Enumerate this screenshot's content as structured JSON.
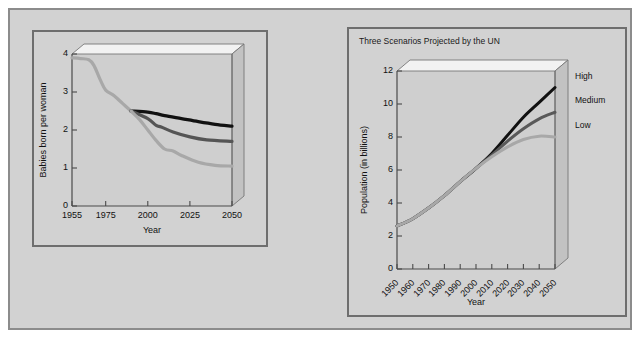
{
  "figure": {
    "background_color": "#d2d2d2",
    "border_color": "#8c8c8c"
  },
  "chart_data": [
    {
      "id": "fertility",
      "type": "line",
      "title": "",
      "xlabel": "Year",
      "ylabel": "Babies born per woman",
      "xlim": [
        1955,
        2050
      ],
      "ylim": [
        0,
        4
      ],
      "xticks": [
        "1955",
        "1975",
        "2000",
        "2025",
        "2050"
      ],
      "xtick_values": [
        1955,
        1975,
        2000,
        2025,
        2050
      ],
      "yticks": [
        "0",
        "1",
        "2",
        "3",
        "4"
      ],
      "ytick_values": [
        0,
        1,
        2,
        3,
        4
      ],
      "grid": false,
      "legend": "none",
      "style": "3d-box",
      "series": [
        {
          "name": "Historical",
          "color": "#a8a8a8",
          "width": 3.2,
          "x": [
            1955,
            1960,
            1965,
            1968,
            1972,
            1975,
            1980,
            1985,
            1990
          ],
          "values": [
            3.9,
            3.88,
            3.85,
            3.7,
            3.3,
            3.05,
            2.9,
            2.7,
            2.5
          ]
        },
        {
          "name": "High",
          "color": "#111111",
          "width": 3.2,
          "x": [
            1990,
            2000,
            2005,
            2010,
            2020,
            2030,
            2040,
            2050
          ],
          "values": [
            2.5,
            2.47,
            2.43,
            2.38,
            2.3,
            2.22,
            2.15,
            2.1
          ]
        },
        {
          "name": "Medium",
          "color": "#555555",
          "width": 3.2,
          "x": [
            1990,
            2000,
            2005,
            2008,
            2015,
            2025,
            2035,
            2050
          ],
          "values": [
            2.5,
            2.3,
            2.12,
            2.08,
            1.95,
            1.82,
            1.74,
            1.7
          ]
        },
        {
          "name": "Low",
          "color": "#a8a8a8",
          "width": 3.2,
          "x": [
            1990,
            1995,
            2000,
            2005,
            2010,
            2015,
            2020,
            2030,
            2040,
            2050
          ],
          "values": [
            2.5,
            2.28,
            2.0,
            1.72,
            1.5,
            1.45,
            1.33,
            1.15,
            1.07,
            1.05
          ]
        }
      ]
    },
    {
      "id": "population",
      "type": "line",
      "title": "Three Scenarios Projected by the UN",
      "xlabel": "Year",
      "ylabel": "Population (in billions)",
      "xlim": [
        1950,
        2050
      ],
      "ylim": [
        0,
        12
      ],
      "xticks": [
        "1950",
        "1960",
        "1970",
        "1980",
        "1990",
        "2000",
        "2010",
        "2020",
        "2030",
        "2040",
        "2050"
      ],
      "xtick_values": [
        1950,
        1960,
        1970,
        1980,
        1990,
        2000,
        2010,
        2020,
        2030,
        2040,
        2050
      ],
      "yticks": [
        "0",
        "2",
        "4",
        "6",
        "8",
        "10",
        "12"
      ],
      "ytick_values": [
        0,
        2,
        4,
        6,
        8,
        10,
        12
      ],
      "grid": false,
      "legend": "right-outside",
      "style": "3d-box",
      "series": [
        {
          "name": "High",
          "label": "High",
          "color": "#111111",
          "width": 3.0,
          "x": [
            1950,
            1960,
            1970,
            1980,
            1990,
            2000,
            2010,
            2020,
            2030,
            2040,
            2050
          ],
          "values": [
            2.6,
            3.05,
            3.7,
            4.45,
            5.3,
            6.1,
            7.0,
            8.1,
            9.2,
            10.1,
            11.0
          ]
        },
        {
          "name": "Medium",
          "label": "Medium",
          "color": "#595959",
          "width": 3.0,
          "x": [
            1950,
            1960,
            1970,
            1980,
            1990,
            2000,
            2010,
            2020,
            2030,
            2040,
            2050
          ],
          "values": [
            2.6,
            3.05,
            3.7,
            4.45,
            5.3,
            6.1,
            6.9,
            7.75,
            8.5,
            9.1,
            9.5
          ]
        },
        {
          "name": "Low",
          "label": "Low",
          "color": "#a8a8a8",
          "width": 3.0,
          "x": [
            1950,
            1960,
            1970,
            1980,
            1990,
            2000,
            2010,
            2020,
            2030,
            2040,
            2050
          ],
          "values": [
            2.6,
            3.05,
            3.7,
            4.45,
            5.3,
            6.1,
            6.8,
            7.4,
            7.85,
            8.05,
            8.0
          ]
        }
      ]
    }
  ]
}
